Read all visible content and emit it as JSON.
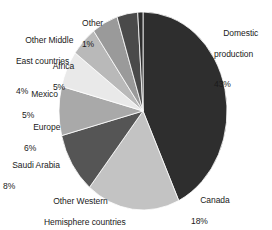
{
  "chart_data": {
    "type": "pie",
    "title": "",
    "subtitle": "",
    "xlabel": "",
    "ylabel": "",
    "legend_position": "labels-around-pie",
    "grid": false,
    "units": "percent",
    "total": 100,
    "start_angle_deg": 0,
    "direction": "clockwise",
    "categories": [
      "Domestic production",
      "Canada",
      "Other Western Hemisphere countries",
      "Saudi Arabia",
      "Europe",
      "Mexico",
      "Africa",
      "Other Middle East countries",
      "Other"
    ],
    "values": [
      43,
      18,
      10,
      8,
      6,
      5,
      5,
      4,
      1
    ],
    "slices": [
      {
        "label": "Domestic production",
        "label_line1": "Domestic",
        "label_line2": "production",
        "value": 43,
        "pct_text": "43%",
        "color": "#2e2e2e"
      },
      {
        "label": "Canada",
        "label_line1": "Canada",
        "label_line2": "",
        "value": 18,
        "pct_text": "18%",
        "color": "#c3c3c3"
      },
      {
        "label": "Other Western Hemisphere countries",
        "label_line1": "Other Western",
        "label_line2": "Hemisphere countries",
        "value": 10,
        "pct_text": "10%",
        "color": "#555555"
      },
      {
        "label": "Saudi Arabia",
        "label_line1": "Saudi Arabia",
        "label_line2": "",
        "value": 8,
        "pct_text": "8%",
        "color": "#a9a9a9"
      },
      {
        "label": "Europe",
        "label_line1": "Europe",
        "label_line2": "",
        "value": 6,
        "pct_text": "6%",
        "color": "#e9e9e9"
      },
      {
        "label": "Mexico",
        "label_line1": "Mexico",
        "label_line2": "",
        "value": 5,
        "pct_text": "5%",
        "color": "#b9b9b9"
      },
      {
        "label": "Africa",
        "label_line1": "Africa",
        "label_line2": "",
        "value": 5,
        "pct_text": "5%",
        "color": "#9a9a9a"
      },
      {
        "label": "Other Middle East countries",
        "label_line1": "Other Middle",
        "label_line2": "East countries",
        "value": 4,
        "pct_text": "4%",
        "color": "#4a4a4a"
      },
      {
        "label": "Other",
        "label_line1": "Other",
        "label_line2": "",
        "value": 1,
        "pct_text": "1%",
        "color": "#2e2e2e"
      }
    ],
    "geometry": {
      "cx": 143,
      "cy": 111,
      "rx": 84,
      "ry": 99
    }
  }
}
